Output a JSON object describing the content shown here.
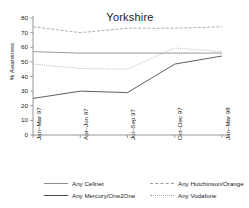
{
  "chart_data": {
    "type": "line",
    "title": "Yorkshire",
    "xlabel": "",
    "ylabel": "% Awareness",
    "categories": [
      "Jan–Mar 97",
      "Apr–Jun 97",
      "Jul–Sep 97",
      "Oct–Dec 97",
      "Jan–Mar 98"
    ],
    "ylim": [
      0,
      80
    ],
    "yticks": [
      0,
      10,
      20,
      30,
      40,
      50,
      60,
      70,
      80
    ],
    "grid": false,
    "legend_position": "bottom",
    "series": [
      {
        "name": "Any Cellnet",
        "values": [
          57,
          56,
          56,
          56,
          56
        ],
        "color": "#8c8c8c",
        "style": "solid"
      },
      {
        "name": "Any Mercury/One2One",
        "values": [
          25,
          30,
          29,
          48.5,
          54
        ],
        "color": "#4d4d4d",
        "style": "solid"
      },
      {
        "name": "Any Hutchinson/Orange",
        "values": [
          74,
          70,
          73,
          73,
          74
        ],
        "color": "#9a9a9a",
        "style": "dashed"
      },
      {
        "name": "Any Vodafone",
        "values": [
          48.5,
          45.5,
          45,
          59.5,
          57
        ],
        "color": "#a5a5a5",
        "style": "dotted"
      }
    ]
  },
  "axis": {
    "ytick_labels": [
      "80",
      "70",
      "60",
      "50",
      "40",
      "30",
      "20",
      "10",
      "0"
    ],
    "xtick_labels": [
      "Jan–Mar 97",
      "Apr–Jun 97",
      "Jul–Sep 97",
      "Oct–Dec 97",
      "Jan–Mar 98"
    ]
  },
  "legend": {
    "items": [
      {
        "label": "Any Cellnet",
        "color": "#8c8c8c",
        "style": "solid"
      },
      {
        "label": "Any Hutchinson/Orange",
        "color": "#9a9a9a",
        "style": "dashed"
      },
      {
        "label": "Any Mercury/One2One",
        "color": "#4d4d4d",
        "style": "solid"
      },
      {
        "label": "Any Vodafone",
        "color": "#a5a5a5",
        "style": "dotted"
      }
    ]
  }
}
